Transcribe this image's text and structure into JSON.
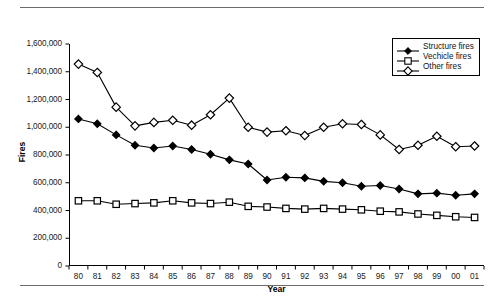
{
  "chart_data": {
    "type": "line",
    "title": "",
    "xlabel": "Year",
    "ylabel": "Fires",
    "categories": [
      "80",
      "81",
      "82",
      "83",
      "84",
      "85",
      "86",
      "87",
      "88",
      "89",
      "90",
      "91",
      "92",
      "93",
      "94",
      "95",
      "96",
      "97",
      "98",
      "99",
      "00",
      "01"
    ],
    "ylim": [
      0,
      1600000
    ],
    "ytick_values": [
      0,
      200000,
      400000,
      600000,
      800000,
      1000000,
      1200000,
      1400000,
      1600000
    ],
    "ytick_labels": [
      "0",
      "200,000",
      "400,000",
      "600,000",
      "800,000",
      "1,000,000",
      "1,200,000",
      "1,400,000",
      "1,600,000"
    ],
    "grid": false,
    "legend_position": "top-right",
    "series": [
      {
        "name": "Structure fires",
        "marker": "filled-diamond",
        "values": [
          1060000,
          1025000,
          945000,
          870000,
          850000,
          865000,
          840000,
          805000,
          765000,
          735000,
          620000,
          640000,
          635000,
          610000,
          600000,
          575000,
          580000,
          555000,
          520000,
          525000,
          510000,
          520000
        ]
      },
      {
        "name": "Vechicle fires",
        "marker": "open-square",
        "values": [
          470000,
          470000,
          445000,
          450000,
          455000,
          470000,
          455000,
          450000,
          460000,
          430000,
          425000,
          415000,
          410000,
          415000,
          410000,
          405000,
          395000,
          390000,
          375000,
          365000,
          355000,
          350000
        ]
      },
      {
        "name": "Other fires",
        "marker": "open-diamond",
        "values": [
          1455000,
          1395000,
          1145000,
          1010000,
          1035000,
          1050000,
          1015000,
          1090000,
          1210000,
          1000000,
          965000,
          975000,
          940000,
          1000000,
          1025000,
          1020000,
          945000,
          840000,
          870000,
          935000,
          860000,
          865000
        ]
      }
    ]
  },
  "legend": {
    "items": [
      {
        "label": "Structure fires",
        "marker": "filled-diamond"
      },
      {
        "label": "Vechicle fires",
        "marker": "open-square"
      },
      {
        "label": "Other fires",
        "marker": "open-diamond"
      }
    ]
  }
}
